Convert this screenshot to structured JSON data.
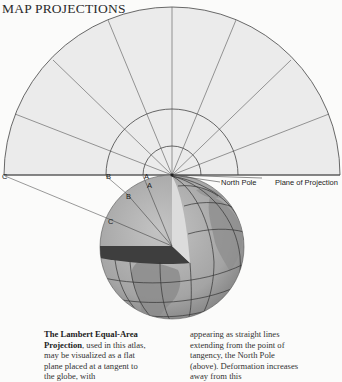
{
  "header": {
    "title": "MAP PROJECTIONS"
  },
  "diagram": {
    "labels": {
      "c_plane": "C",
      "b_plane": "B",
      "a_plane": "A",
      "a_globe": "A",
      "b_globe": "B",
      "c_globe": "C",
      "north_pole": "North Pole",
      "plane_of_projection": "Plane of Projection"
    },
    "colors": {
      "plane_fill": "#ebebeb",
      "line": "#3a3a3a",
      "globe_ocean": "#a9a9a9",
      "globe_land": "#8a8a8a",
      "section_dark": "#3e3e3e",
      "section_light": "#dadada"
    }
  },
  "caption": {
    "col1_bold": "The Lambert Equal-Area Projection",
    "col1_text": ", used in this atlas, may be visualized as a flat plane placed at a tangent to the globe, with",
    "col2_text": "appearing as straight lines extending from the point of tangency, the North Pole (above). Deformation increases away from this"
  }
}
